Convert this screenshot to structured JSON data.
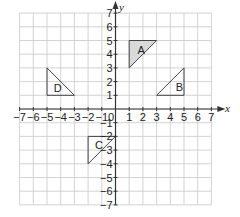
{
  "chart_data": {
    "type": "coordinate-grid",
    "title": "",
    "xlabel": "x",
    "ylabel": "y",
    "xlim": [
      -7,
      7
    ],
    "ylim": [
      -7,
      7
    ],
    "grid": true,
    "origin_label": "0",
    "x_ticks": [
      -7,
      -6,
      -5,
      -4,
      -3,
      -2,
      -1,
      1,
      2,
      3,
      4,
      5,
      6,
      7
    ],
    "y_ticks": [
      -7,
      -6,
      -5,
      -4,
      -3,
      -2,
      -1,
      1,
      2,
      3,
      4,
      5,
      6,
      7
    ],
    "shapes": [
      {
        "label": "A",
        "vertices": [
          [
            1,
            3
          ],
          [
            1,
            5
          ],
          [
            3,
            5
          ]
        ],
        "shaded": true,
        "label_at": [
          1.6,
          4.3
        ]
      },
      {
        "label": "B",
        "vertices": [
          [
            3,
            1
          ],
          [
            5,
            1
          ],
          [
            5,
            3
          ]
        ],
        "shaded": false,
        "label_at": [
          4.4,
          1.6
        ]
      },
      {
        "label": "C",
        "vertices": [
          [
            -2,
            -2
          ],
          [
            0,
            -2
          ],
          [
            -2,
            -4
          ]
        ],
        "shaded": false,
        "label_at": [
          -1.5,
          -2.6
        ]
      },
      {
        "label": "D",
        "vertices": [
          [
            -5,
            1
          ],
          [
            -5,
            3
          ],
          [
            -3,
            1
          ]
        ],
        "shaded": false,
        "label_at": [
          -4.5,
          1.5
        ]
      }
    ],
    "colors": {
      "grid": "#c8c8c8",
      "axis": "#333333",
      "shape_stroke": "#444444",
      "shaded_fill": "#d9d9d9"
    }
  }
}
